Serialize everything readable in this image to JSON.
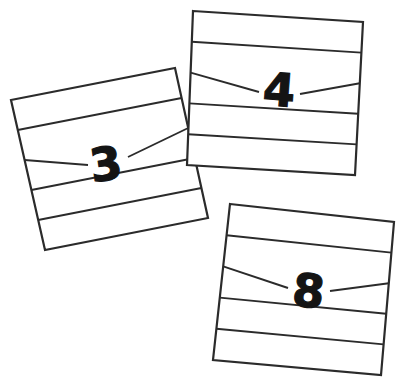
{
  "scene": {
    "title": "Three ruled index cards with handwritten digits",
    "width": 405,
    "height": 378,
    "background_color": "#ffffff",
    "ink_color": "#2b2b2b",
    "digit_color": "#141414"
  },
  "cards": [
    {
      "id": "card-4",
      "digit": "4",
      "position": "top-right",
      "rotation_deg": 4.5,
      "corners": [
        [
          193,
          11
        ],
        [
          363,
          22
        ],
        [
          355,
          175
        ],
        [
          187,
          165
        ]
      ],
      "rule_count": 4,
      "digit_on_rule_index": 2,
      "digit_x": 278,
      "digit_y": 106,
      "digit_font_size": 46,
      "left_dash": {
        "x1": 232,
        "y1": 90,
        "x2": 259,
        "y2": 92
      },
      "right_dash": {
        "x1": 300,
        "y1": 94,
        "x2": 345,
        "y2": 97
      },
      "z": 3
    },
    {
      "id": "card-3",
      "digit": "3",
      "position": "left",
      "rotation_deg": -8.0,
      "corners": [
        [
          11,
          100
        ],
        [
          175,
          68
        ],
        [
          208,
          218
        ],
        [
          45,
          250
        ]
      ],
      "rule_count": 4,
      "digit_on_rule_index": 2,
      "digit_x": 108,
      "digit_y": 180,
      "digit_font_size": 46,
      "left_dash": {
        "x1": 60,
        "y1": 170,
        "x2": 88,
        "y2": 165
      },
      "right_dash": {
        "x1": 128,
        "y1": 157,
        "x2": 183,
        "y2": 147
      },
      "z": 2
    },
    {
      "id": "card-8",
      "digit": "8",
      "position": "bottom-right",
      "rotation_deg": 6.0,
      "corners": [
        [
          230,
          204
        ],
        [
          394,
          222
        ],
        [
          381,
          375
        ],
        [
          213,
          360
        ]
      ],
      "rule_count": 4,
      "digit_on_rule_index": 2,
      "digit_x": 307,
      "digit_y": 307,
      "digit_font_size": 46,
      "left_dash": {
        "x1": 257,
        "y1": 285,
        "x2": 288,
        "y2": 288
      },
      "right_dash": {
        "x1": 330,
        "y1": 291,
        "x2": 378,
        "y2": 296
      },
      "z": 1
    }
  ]
}
